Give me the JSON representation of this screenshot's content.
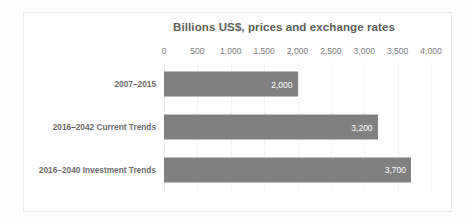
{
  "chart_data": {
    "type": "bar",
    "orientation": "horizontal",
    "title": "Billions US$, prices and exchange rates",
    "xlabel": "",
    "ylabel": "",
    "categories": [
      "2007–2015",
      "2016–2042 Current Trends",
      "2016–2040 Investment Trends"
    ],
    "values": [
      2000,
      3200,
      3700
    ],
    "value_labels": [
      "2,000",
      "3,200",
      "3,700"
    ],
    "xlim": [
      0,
      4000
    ],
    "xticks": [
      0,
      500,
      1000,
      1500,
      2000,
      2500,
      3000,
      3500,
      4000
    ],
    "xtick_labels": [
      "0",
      "500",
      "1,000",
      "1,500",
      "2,000",
      "2,500",
      "3,000",
      "3,500",
      "4,000"
    ],
    "grid": true,
    "grid_axis": "x",
    "legend": false,
    "axis_position": "top",
    "bar_color": "#808080",
    "value_label_color": "#ffffff",
    "title_color": "#5e5e5e",
    "tick_label_color": "#7a7a7a",
    "category_label_color": "#6b6b6b",
    "gridline_color": "#f2f2f2",
    "plot_background": "#ffffff",
    "frame_border_color": "#eaeaea"
  }
}
